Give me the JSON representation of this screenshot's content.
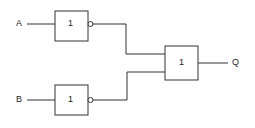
{
  "diagram": {
    "type": "logic-circuit",
    "inputs": [
      {
        "label": "A"
      },
      {
        "label": "B"
      }
    ],
    "gates": [
      {
        "id": "gate-a",
        "symbol": "1",
        "inverted_output": true
      },
      {
        "id": "gate-b",
        "symbol": "1",
        "inverted_output": true
      },
      {
        "id": "gate-out",
        "symbol": "1",
        "inverted_output": false
      }
    ],
    "output": {
      "label": "Q"
    },
    "colors": {
      "line": "#333333",
      "background": "#ffffff"
    }
  }
}
